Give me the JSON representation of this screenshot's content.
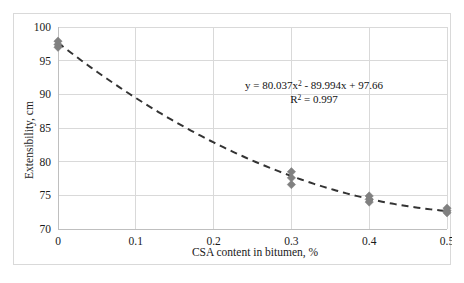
{
  "chart_data": {
    "type": "scatter",
    "title": "",
    "xlabel": "CSA content in bitumen, %",
    "ylabel": "Extensibility, cm",
    "xlim": [
      0,
      0.5
    ],
    "ylim": [
      70,
      100
    ],
    "xticks": [
      "0",
      "0.1",
      "0.2",
      "0.3",
      "0.4",
      "0.5"
    ],
    "xtick_values": [
      0,
      0.1,
      0.2,
      0.3,
      0.4,
      0.5
    ],
    "yticks": [
      "70",
      "75",
      "80",
      "85",
      "90",
      "95",
      "100"
    ],
    "ytick_values": [
      70,
      75,
      80,
      85,
      90,
      95,
      100
    ],
    "grid": true,
    "legend": "none",
    "marker": "diamond",
    "marker_color": "#808080",
    "trendline": {
      "style": "dashed",
      "color": "#333333",
      "type": "polynomial-2",
      "coefficients": [
        80.037,
        -89.994,
        97.66
      ]
    },
    "series": [
      {
        "name": "Extensibility",
        "points": [
          {
            "x": 0,
            "y": 97.9
          },
          {
            "x": 0,
            "y": 97.4
          },
          {
            "x": 0,
            "y": 97.0
          },
          {
            "x": 0.3,
            "y": 78.5
          },
          {
            "x": 0.3,
            "y": 77.6
          },
          {
            "x": 0.3,
            "y": 76.6
          },
          {
            "x": 0.4,
            "y": 74.9
          },
          {
            "x": 0.4,
            "y": 74.4
          },
          {
            "x": 0.4,
            "y": 74.0
          },
          {
            "x": 0.5,
            "y": 73.1
          },
          {
            "x": 0.5,
            "y": 72.7
          },
          {
            "x": 0.5,
            "y": 72.4
          }
        ]
      }
    ],
    "annotations": {
      "equation_line1_prefix": "y = 80.037x",
      "equation_line1_sup": "2",
      "equation_line1_suffix": " - 89.994x + 97.66",
      "equation_line2_prefix": "R",
      "equation_line2_sup": "2",
      "equation_line2_suffix": " = 0.997",
      "equation_full": "y = 80.037x² - 89.994x + 97.66",
      "r_squared_full": "R² = 0.997"
    }
  },
  "colors": {
    "marker": "#808080",
    "trendline": "#333333",
    "gridline": "#d9d9d9",
    "axis": "#bfbfbf",
    "border": "#d9d9d9",
    "text": "#1a1a1a"
  }
}
